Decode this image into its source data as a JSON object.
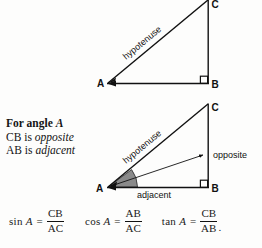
{
  "figure": {
    "title_semantic": "right-triangle-trigonometry-diagram",
    "colors": {
      "ink": "#111111",
      "background": "#fdfdfc",
      "angle_fill": "#8a8a8a",
      "angle_stroke": "#3a3a3a"
    },
    "triangle_top": {
      "vertices": {
        "A": "A",
        "B": "B",
        "C": "C"
      },
      "hypotenuse_label": "hypotenuse",
      "right_angle_at": "B"
    },
    "triangle_bottom": {
      "vertices": {
        "A": "A",
        "B": "B",
        "C": "C"
      },
      "hypotenuse_label": "hypotenuse",
      "opposite_label": "opposite",
      "adjacent_label": "adjacent",
      "right_angle_at": "B",
      "shaded_angle_at": "A"
    }
  },
  "prose": {
    "heading_prefix": "For angle",
    "heading_var": "A",
    "line2_prefix": "CB is",
    "line2_em": "opposite",
    "line3_prefix": "AB is",
    "line3_em": "adjacent"
  },
  "formulas": [
    {
      "id": "sine",
      "fn": "sin",
      "arg": "A",
      "eq": "=",
      "numerator": "CB",
      "denominator": "AC",
      "trailing": ""
    },
    {
      "id": "cosine",
      "fn": "cos",
      "arg": "A",
      "eq": "=",
      "numerator": "AB",
      "denominator": "AC",
      "trailing": ""
    },
    {
      "id": "tangent",
      "fn": "tan",
      "arg": "A",
      "eq": "=",
      "numerator": "CB",
      "denominator": "AB",
      "trailing": "."
    }
  ]
}
